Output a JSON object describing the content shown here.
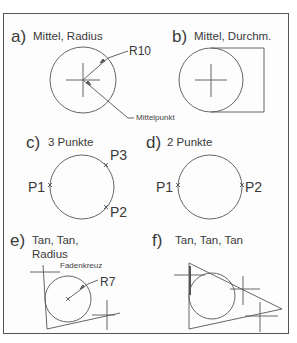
{
  "diagram": {
    "panels": [
      {
        "id": "a",
        "letter": "a)",
        "title": "Mittel, Radius",
        "annotations": {
          "radius": "R10",
          "center": "Mittelpunkt"
        }
      },
      {
        "id": "b",
        "letter": "b)",
        "title": "Mittel, Durchm."
      },
      {
        "id": "c",
        "letter": "c)",
        "title": "3 Punkte",
        "points": [
          "P1",
          "P2",
          "P3"
        ]
      },
      {
        "id": "d",
        "letter": "d)",
        "title": "2 Punkte",
        "points": [
          "P1",
          "P2"
        ]
      },
      {
        "id": "e",
        "letter": "e)",
        "title_line1": "Tan, Tan,",
        "title_line2": "Radius",
        "annotations": {
          "crosshair": "Fadenkreuz",
          "radius": "R7"
        }
      },
      {
        "id": "f",
        "letter": "f)",
        "title": "Tan, Tan, Tan"
      }
    ],
    "colors": {
      "line": "#555555",
      "text": "#3a3a3a",
      "frame": "#555555"
    }
  }
}
